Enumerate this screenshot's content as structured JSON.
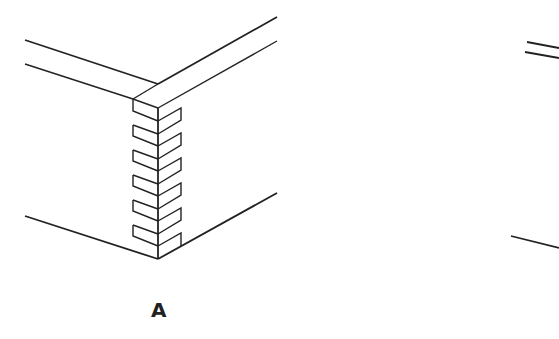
{
  "figure": {
    "panels": [
      {
        "id": "A",
        "label": "A",
        "description": "Corner joint with interlocking dovetail/finger pins"
      },
      {
        "id": "B",
        "label": "",
        "description": "Partially visible second joint drawing (cropped at right edge)"
      }
    ]
  },
  "colors": {
    "line": "#222222",
    "background": "#ffffff"
  }
}
